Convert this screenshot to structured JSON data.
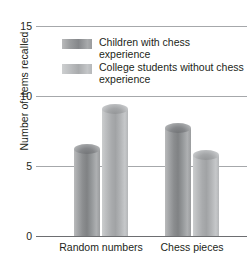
{
  "chart_data": {
    "type": "bar",
    "title": "",
    "xlabel": "",
    "ylabel": "Number of items recalled",
    "categories": [
      "Random numbers",
      "Chess pieces"
    ],
    "series": [
      {
        "name": "Children with chess experience",
        "color": "#8b8d8f",
        "values": [
          6.2,
          7.7
        ]
      },
      {
        "name": "College students without chess experience",
        "color": "#b4b6b8",
        "values": [
          9.1,
          5.8
        ]
      }
    ],
    "ylim": [
      0,
      15
    ],
    "yticks": [
      0,
      5,
      10,
      15
    ],
    "ytick_labels": [
      "0",
      "5",
      "10",
      "15"
    ],
    "grid": true,
    "legend_position": "top-center"
  },
  "axis": {
    "y_title": "Number of items recalled",
    "ticks": [
      {
        "label": "15",
        "value": 15
      },
      {
        "label": "10",
        "value": 10
      },
      {
        "label": "5",
        "value": 5
      },
      {
        "label": "0",
        "value": 0
      }
    ]
  },
  "legend": {
    "entries": [
      {
        "label": "Children with chess experience",
        "swatch": "series-a-swatch"
      },
      {
        "label": "College students without chess experience",
        "swatch": "series-b-swatch"
      }
    ]
  },
  "categories": [
    {
      "label": "Random numbers"
    },
    {
      "label": "Chess pieces"
    }
  ]
}
